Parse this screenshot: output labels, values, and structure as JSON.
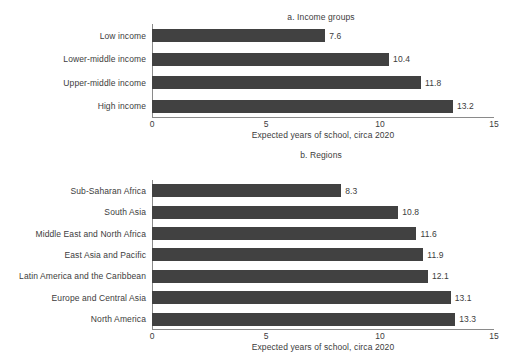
{
  "axis": {
    "x_ticks": [
      "0",
      "5",
      "10",
      "15"
    ],
    "x_label": "Expected years of school, circa 2020",
    "x_min": 0,
    "x_max": 15
  },
  "panel_a": {
    "title": "a. Income groups",
    "x_label": "Expected years of school, circa 2020",
    "categories": [
      "Low income",
      "Lower-middle income",
      "Upper-middle income",
      "High income"
    ],
    "values": [
      7.6,
      10.4,
      11.8,
      13.2
    ],
    "value_labels": [
      "7.6",
      "10.4",
      "11.8",
      "13.2"
    ]
  },
  "panel_b": {
    "title": "b. Regions",
    "x_label": "Expected years of school, circa 2020",
    "categories": [
      "Sub-Saharan Africa",
      "South Asia",
      "Middle East and North Africa",
      "East Asia and Pacific",
      "Latin America and the Caribbean",
      "Europe and Central Asia",
      "North America"
    ],
    "values": [
      8.3,
      10.8,
      11.6,
      11.9,
      12.1,
      13.1,
      13.3
    ],
    "value_labels": [
      "8.3",
      "10.8",
      "11.6",
      "11.9",
      "12.1",
      "13.1",
      "13.3"
    ]
  },
  "colors": {
    "bar": "#414141",
    "axis": "#8a8a8a",
    "text": "#3c3c3c",
    "background": "#ffffff"
  },
  "chart_data": [
    {
      "type": "bar",
      "orientation": "horizontal",
      "title": "a. Income groups",
      "categories": [
        "Low income",
        "Lower-middle income",
        "Upper-middle income",
        "High income"
      ],
      "values": [
        7.6,
        10.4,
        11.8,
        13.2
      ],
      "xlabel": "Expected years of school, circa 2020",
      "ylabel": "",
      "xlim": [
        0,
        15
      ],
      "xticks": [
        0,
        5,
        10,
        15
      ],
      "grid": false,
      "legend": "none",
      "data_labels": true,
      "series": [
        {
          "name": "Expected years of school, circa 2020",
          "values": [
            7.6,
            10.4,
            11.8,
            13.2
          ]
        }
      ]
    },
    {
      "type": "bar",
      "orientation": "horizontal",
      "title": "b. Regions",
      "categories": [
        "Sub-Saharan Africa",
        "South Asia",
        "Middle East and North Africa",
        "East Asia and Pacific",
        "Latin America and the Caribbean",
        "Europe and Central Asia",
        "North America"
      ],
      "values": [
        8.3,
        10.8,
        11.6,
        11.9,
        12.1,
        13.1,
        13.3
      ],
      "xlabel": "Expected years of school, circa 2020",
      "ylabel": "",
      "xlim": [
        0,
        15
      ],
      "xticks": [
        0,
        5,
        10,
        15
      ],
      "grid": false,
      "legend": "none",
      "data_labels": true,
      "series": [
        {
          "name": "Expected years of school, circa 2020",
          "values": [
            8.3,
            10.8,
            11.6,
            11.9,
            12.1,
            13.1,
            13.3
          ]
        }
      ]
    }
  ]
}
